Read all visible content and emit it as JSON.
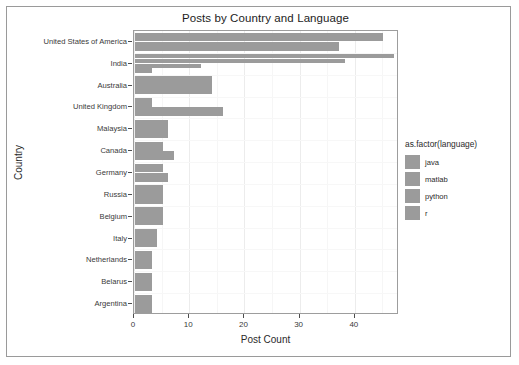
{
  "chart_data": {
    "type": "bar",
    "orientation": "horizontal",
    "title": "Posts by Country and Language",
    "xlabel": "Post Count",
    "ylabel": "Country",
    "xlim": [
      0,
      48
    ],
    "xticks": [
      0,
      10,
      20,
      30,
      40
    ],
    "xtick_labels": [
      "0",
      "10",
      "20",
      "30",
      "40"
    ],
    "grid": true,
    "legend_position": "right",
    "legend_title": "as.factor(language)",
    "categories": [
      "United States of America",
      "India",
      "Australia",
      "United Kingdom",
      "Malaysia",
      "Canada",
      "Germany",
      "Russia",
      "Belgium",
      "Italy",
      "Netherlands",
      "Belarus",
      "Argentina"
    ],
    "series": [
      {
        "name": "java",
        "color": "#9b9b9b",
        "values": [
          45,
          47,
          14,
          3,
          6,
          5,
          5,
          5,
          5,
          4,
          3,
          3,
          3
        ]
      },
      {
        "name": "matlab",
        "color": "#9b9b9b",
        "values": [
          37,
          38,
          0,
          16,
          0,
          7,
          6,
          0,
          0,
          0,
          0,
          0,
          0
        ]
      },
      {
        "name": "python",
        "color": "#9b9b9b",
        "values": [
          0,
          12,
          0,
          0,
          0,
          0,
          0,
          0,
          0,
          0,
          0,
          0,
          0
        ]
      },
      {
        "name": "r",
        "color": "#9b9b9b",
        "values": [
          0,
          3,
          0,
          0,
          0,
          0,
          0,
          0,
          0,
          0,
          0,
          0,
          0
        ]
      }
    ]
  },
  "legend": {
    "title": "as.factor(language)",
    "items": [
      {
        "label": "java",
        "color": "#9b9b9b"
      },
      {
        "label": "matlab",
        "color": "#9b9b9b"
      },
      {
        "label": "python",
        "color": "#9b9b9b"
      },
      {
        "label": "r",
        "color": "#9b9b9b"
      }
    ]
  }
}
